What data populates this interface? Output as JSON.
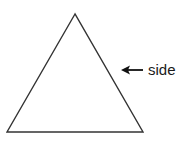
{
  "diagram": {
    "shape": "equilateral-triangle",
    "stroke_color": "#333333",
    "vertices": {
      "apex": [
        75,
        14
      ],
      "bottom_left": [
        7,
        132
      ],
      "bottom_right": [
        143,
        132
      ]
    },
    "annotation": {
      "label": "side",
      "arrow_direction": "left",
      "arrow_from": [
        143,
        70
      ],
      "arrow_to": [
        122,
        70
      ]
    }
  }
}
